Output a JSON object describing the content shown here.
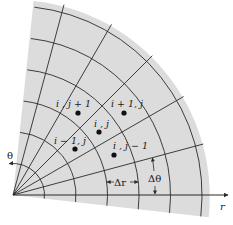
{
  "figure": {
    "type": "polar finite-difference grid",
    "colors": {
      "background": "#ffffff",
      "sector_fill": "#dcdcdc",
      "lines": "#2a2a2a",
      "nodes": "#111111"
    },
    "grid": {
      "origin": [
        13,
        195
      ],
      "arc_radii_px": [
        31.5,
        63,
        94.5,
        126,
        157.5,
        189
      ],
      "radial_angles_deg": [
        0,
        15,
        30,
        45,
        60,
        75
      ],
      "sector_radius_px": 197,
      "sector_angle_range_deg": [
        -6.5,
        84
      ]
    },
    "axes": {
      "r_label": "r",
      "theta_label": "θ"
    },
    "annotations": {
      "delta_r": "Δr",
      "delta_theta": "Δθ"
    },
    "nodes": [
      {
        "label": "i , j + 1",
        "x": 78,
        "y": 113
      },
      {
        "label": "i + 1, j",
        "x": 124,
        "y": 113
      },
      {
        "label": "i , j",
        "x": 99,
        "y": 132
      },
      {
        "label": "i − 1, j",
        "x": 75,
        "y": 149
      },
      {
        "label": "i , j − 1",
        "x": 114,
        "y": 155
      }
    ]
  }
}
